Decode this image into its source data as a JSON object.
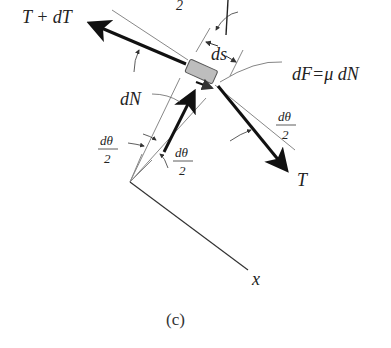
{
  "figure": {
    "caption": "(c)",
    "labels": {
      "tension_upper": "T + dT",
      "tension_lower": "T",
      "normal_force": "dN",
      "friction": "dF=μ dN",
      "arc_length": "ds",
      "axis_x": "x",
      "half_angle_numerator": "dθ",
      "half_angle_denominator": "2",
      "top_partial_denominator": "2"
    },
    "colors": {
      "ink": "#111111",
      "thin_line": "#777777",
      "element_fill": "#bdbdbd",
      "element_stroke": "#555555"
    }
  }
}
